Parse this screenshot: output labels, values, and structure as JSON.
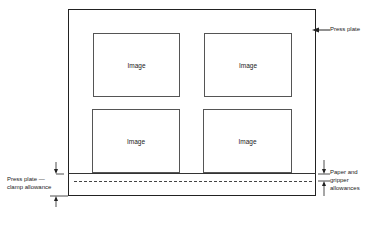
{
  "diagram": {
    "images": [
      {
        "label": "Image"
      },
      {
        "label": "Image"
      },
      {
        "label": "Image"
      },
      {
        "label": "Image"
      }
    ],
    "labels": {
      "press_plate": "Press plate",
      "clamp_line1": "Press plate —",
      "clamp_line2": "clamp allowance",
      "gripper_line1": "Paper and",
      "gripper_line2": "gripper",
      "gripper_line3": "allowances"
    },
    "colors": {
      "line": "#222222",
      "background": "#ffffff"
    }
  }
}
